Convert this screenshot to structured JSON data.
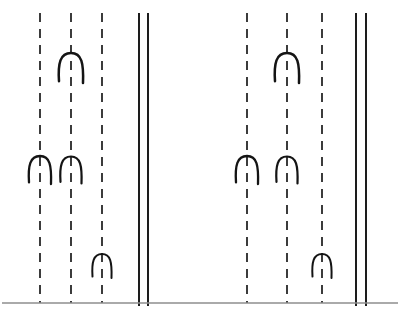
{
  "figure": {
    "canvas": {
      "width": 408,
      "height": 317,
      "background": "#ffffff"
    },
    "colors": {
      "ink": "#1a1a1a",
      "solid_rule": "#111111",
      "glyph": "#141414",
      "baseline": "#8e8e8e",
      "background": "#ffffff"
    }
  },
  "chart_data": {
    "type": "diagram",
    "xlabel": "",
    "ylabel": "",
    "xlim": [
      0,
      408
    ],
    "ylim": [
      0,
      317
    ],
    "grid": false,
    "legend": "none",
    "groups": [
      {
        "name": "left-group",
        "dashed_rules": [
          {
            "id": "left-rule-1",
            "x": 40,
            "y_top": 13,
            "y_bottom": 303
          },
          {
            "id": "left-rule-2",
            "x": 71,
            "y_top": 13,
            "y_bottom": 303
          },
          {
            "id": "left-rule-3",
            "x": 102,
            "y_top": 13,
            "y_bottom": 303
          }
        ],
        "solid_rules": [
          {
            "id": "left-double-rule-a",
            "x": 139,
            "y_top": 13,
            "y_bottom": 306
          },
          {
            "id": "left-double-rule-b",
            "x": 148,
            "y_top": 13,
            "y_bottom": 306
          }
        ],
        "glyphs": [
          {
            "id": "left-glyph-1",
            "shape": "arch",
            "cx": 71,
            "cy": 68,
            "width": 24,
            "height": 30
          },
          {
            "id": "left-glyph-2",
            "shape": "arch",
            "cx": 40,
            "cy": 170,
            "width": 22,
            "height": 28
          },
          {
            "id": "left-glyph-3",
            "shape": "arch",
            "cx": 71,
            "cy": 170,
            "width": 21,
            "height": 27
          },
          {
            "id": "left-glyph-4",
            "shape": "arch",
            "cx": 102,
            "cy": 266,
            "width": 19,
            "height": 24
          }
        ]
      },
      {
        "name": "right-group",
        "dashed_rules": [
          {
            "id": "right-rule-1",
            "x": 247,
            "y_top": 13,
            "y_bottom": 303
          },
          {
            "id": "right-rule-2",
            "x": 287,
            "y_top": 13,
            "y_bottom": 303
          },
          {
            "id": "right-rule-3",
            "x": 322,
            "y_top": 13,
            "y_bottom": 303
          }
        ],
        "solid_rules": [
          {
            "id": "right-double-rule-a",
            "x": 356,
            "y_top": 13,
            "y_bottom": 306
          },
          {
            "id": "right-double-rule-b",
            "x": 366,
            "y_top": 13,
            "y_bottom": 306
          }
        ],
        "glyphs": [
          {
            "id": "right-glyph-1",
            "shape": "arch",
            "cx": 287,
            "cy": 68,
            "width": 24,
            "height": 30
          },
          {
            "id": "right-glyph-2",
            "shape": "arch",
            "cx": 247,
            "cy": 170,
            "width": 22,
            "height": 28
          },
          {
            "id": "right-glyph-3",
            "shape": "arch",
            "cx": 287,
            "cy": 170,
            "width": 21,
            "height": 27
          },
          {
            "id": "right-glyph-4",
            "shape": "arch",
            "cx": 322,
            "cy": 266,
            "width": 19,
            "height": 24
          }
        ]
      }
    ],
    "baseline": {
      "id": "baseline-rule",
      "x_start": 2,
      "x_end": 398,
      "y": 303
    }
  }
}
